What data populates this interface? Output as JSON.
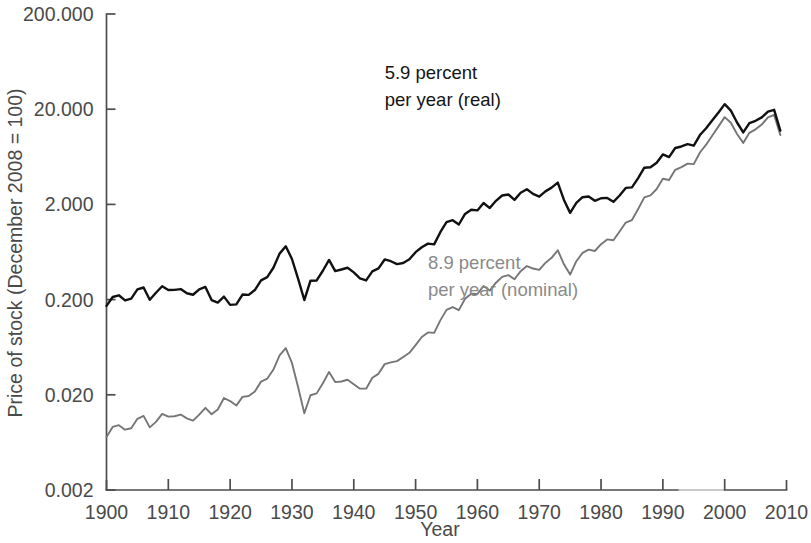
{
  "chart_data": {
    "type": "line",
    "title": "",
    "xlabel": "Year",
    "ylabel": "Price of stock (December 2008 = 100)",
    "xlim": [
      1900,
      2010
    ],
    "ylim": [
      0.002,
      200.0
    ],
    "yscale": "log",
    "xscale": "linear",
    "grid": false,
    "legend_position": "inline-annotations",
    "xticks": [
      1900,
      1910,
      1920,
      1930,
      1940,
      1950,
      1960,
      1970,
      1980,
      1990,
      2000,
      2010
    ],
    "xtick_labels": [
      "1900",
      "1910",
      "1920",
      "1930",
      "1940",
      "1950",
      "1960",
      "1970",
      "1980",
      "1990",
      "2000",
      "2010"
    ],
    "yticks": [
      0.002,
      0.02,
      0.2,
      2.0,
      20.0,
      200.0
    ],
    "ytick_labels": [
      "0.002",
      "0.020",
      "0.200",
      "2.000",
      "20.000",
      "200.000"
    ],
    "annotations": [
      {
        "id": "real-annotation",
        "lines": [
          "5.9 percent",
          "per year (real)"
        ],
        "color": "#141414",
        "x": 1945,
        "y": 42.0
      },
      {
        "id": "nominal-annotation",
        "lines": [
          "8.9 percent",
          "per year (nominal)"
        ],
        "color": "#8a8a8a",
        "x": 1952,
        "y": 0.42
      }
    ],
    "series": [
      {
        "name": "Real (inflation-adjusted) stock price",
        "label": "5.9 percent per year (real)",
        "color": "#111111",
        "x": [
          1900,
          1901,
          1902,
          1903,
          1904,
          1905,
          1906,
          1907,
          1908,
          1909,
          1910,
          1911,
          1912,
          1913,
          1914,
          1915,
          1916,
          1917,
          1918,
          1919,
          1920,
          1921,
          1922,
          1923,
          1924,
          1925,
          1926,
          1927,
          1928,
          1929,
          1930,
          1931,
          1932,
          1933,
          1934,
          1935,
          1936,
          1937,
          1938,
          1939,
          1940,
          1941,
          1942,
          1943,
          1944,
          1945,
          1946,
          1947,
          1948,
          1949,
          1950,
          1951,
          1952,
          1953,
          1954,
          1955,
          1956,
          1957,
          1958,
          1959,
          1960,
          1961,
          1962,
          1963,
          1964,
          1965,
          1966,
          1967,
          1968,
          1969,
          1970,
          1971,
          1972,
          1973,
          1974,
          1975,
          1976,
          1977,
          1978,
          1979,
          1980,
          1981,
          1982,
          1983,
          1984,
          1985,
          1986,
          1987,
          1988,
          1989,
          1990,
          1991,
          1992,
          1993,
          1994,
          1995,
          1996,
          1997,
          1998,
          1999,
          2000,
          2001,
          2002,
          2003,
          2004,
          2005,
          2006,
          2007,
          2008,
          2009
        ],
        "y": [
          0.172,
          0.213,
          0.222,
          0.196,
          0.205,
          0.256,
          0.268,
          0.199,
          0.236,
          0.276,
          0.252,
          0.253,
          0.258,
          0.233,
          0.225,
          0.256,
          0.272,
          0.198,
          0.186,
          0.215,
          0.176,
          0.178,
          0.226,
          0.224,
          0.252,
          0.318,
          0.344,
          0.432,
          0.608,
          0.726,
          0.534,
          0.33,
          0.198,
          0.316,
          0.318,
          0.402,
          0.522,
          0.398,
          0.414,
          0.432,
          0.386,
          0.335,
          0.318,
          0.396,
          0.425,
          0.528,
          0.506,
          0.472,
          0.485,
          0.53,
          0.63,
          0.71,
          0.775,
          0.76,
          1.02,
          1.3,
          1.365,
          1.23,
          1.59,
          1.76,
          1.73,
          2.07,
          1.83,
          2.18,
          2.48,
          2.54,
          2.23,
          2.65,
          2.88,
          2.58,
          2.41,
          2.74,
          3.0,
          3.39,
          2.23,
          1.63,
          2.08,
          2.38,
          2.42,
          2.18,
          2.32,
          2.34,
          2.13,
          2.48,
          2.98,
          3.02,
          3.78,
          4.86,
          4.91,
          5.47,
          6.7,
          6.28,
          7.83,
          8.12,
          8.6,
          8.27,
          10.7,
          12.6,
          15.3,
          18.5,
          22.6,
          19.3,
          14.5,
          11.4,
          14.3,
          15.1,
          16.4,
          18.9,
          19.7,
          11.9
        ]
      },
      {
        "name": "Nominal stock price",
        "label": "8.9 percent per year (nominal)",
        "color": "#767676",
        "x": [
          1900,
          1901,
          1902,
          1903,
          1904,
          1905,
          1906,
          1907,
          1908,
          1909,
          1910,
          1911,
          1912,
          1913,
          1914,
          1915,
          1916,
          1917,
          1918,
          1919,
          1920,
          1921,
          1922,
          1923,
          1924,
          1925,
          1926,
          1927,
          1928,
          1929,
          1930,
          1931,
          1932,
          1933,
          1934,
          1935,
          1936,
          1937,
          1938,
          1939,
          1940,
          1941,
          1942,
          1943,
          1944,
          1945,
          1946,
          1947,
          1948,
          1949,
          1950,
          1951,
          1952,
          1953,
          1954,
          1955,
          1956,
          1957,
          1958,
          1959,
          1960,
          1961,
          1962,
          1963,
          1964,
          1965,
          1966,
          1967,
          1968,
          1969,
          1970,
          1971,
          1972,
          1973,
          1974,
          1975,
          1976,
          1977,
          1978,
          1979,
          1980,
          1981,
          1982,
          1983,
          1984,
          1985,
          1986,
          1987,
          1988,
          1989,
          1990,
          1991,
          1992,
          1993,
          1994,
          1995,
          1996,
          1997,
          1998,
          1999,
          2000,
          2001,
          2002,
          2003,
          2004,
          2005,
          2006,
          2007,
          2008,
          2009
        ],
        "y": [
          0.0072,
          0.0092,
          0.0096,
          0.0086,
          0.0089,
          0.0112,
          0.012,
          0.0091,
          0.0104,
          0.0126,
          0.0118,
          0.0119,
          0.0124,
          0.0113,
          0.0107,
          0.0124,
          0.0146,
          0.0125,
          0.014,
          0.0185,
          0.0172,
          0.0154,
          0.019,
          0.0194,
          0.0217,
          0.0275,
          0.0295,
          0.0368,
          0.0518,
          0.062,
          0.0432,
          0.024,
          0.0128,
          0.0198,
          0.0207,
          0.0265,
          0.0348,
          0.0272,
          0.0276,
          0.0288,
          0.0258,
          0.0232,
          0.0232,
          0.0302,
          0.0332,
          0.042,
          0.0438,
          0.0452,
          0.05,
          0.0552,
          0.0665,
          0.081,
          0.0905,
          0.0895,
          0.121,
          0.156,
          0.167,
          0.155,
          0.204,
          0.23,
          0.229,
          0.278,
          0.249,
          0.301,
          0.347,
          0.362,
          0.327,
          0.398,
          0.45,
          0.424,
          0.41,
          0.486,
          0.55,
          0.66,
          0.469,
          0.366,
          0.506,
          0.618,
          0.67,
          0.648,
          0.765,
          0.858,
          0.84,
          1.04,
          1.29,
          1.37,
          1.79,
          2.37,
          2.49,
          2.9,
          3.72,
          3.61,
          4.62,
          4.93,
          5.36,
          5.3,
          7.02,
          8.48,
          10.6,
          13.2,
          16.5,
          14.4,
          11.0,
          8.85,
          11.3,
          12.3,
          13.8,
          16.4,
          17.4,
          10.7
        ]
      }
    ]
  },
  "axis": {
    "x_title": "Year",
    "y_title": "Price of stock (December 2008 = 100)"
  }
}
